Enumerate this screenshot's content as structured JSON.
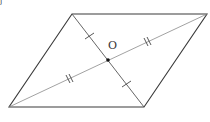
{
  "diagram": {
    "title": "",
    "type": "parallelogram-with-diagonals",
    "center_label": "O",
    "corner_fragment": "j",
    "vertices": {
      "top_left": [
        72,
        14
      ],
      "top_right": [
        207,
        14
      ],
      "bottom_right": [
        144,
        107
      ],
      "bottom_left": [
        9,
        107
      ]
    },
    "intersection": [
      108,
      60
    ],
    "diagonals": [
      {
        "from": "bottom_left",
        "to": "top_right",
        "tick_marks": 2,
        "meaning": "segments equal (double tick)"
      },
      {
        "from": "top_left",
        "to": "bottom_right",
        "tick_marks": 1,
        "meaning": "segments equal (single tick)"
      }
    ],
    "colors": {
      "edge": "#3a3a3a",
      "diagonal": "#8a8a8a",
      "point": "#111111",
      "background": "#ffffff"
    }
  }
}
